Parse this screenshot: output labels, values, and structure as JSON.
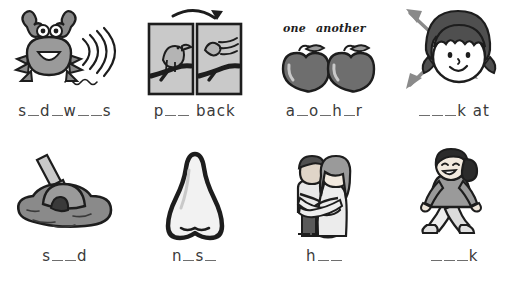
{
  "worksheet": {
    "colors": {
      "ink": "#1d1d1d",
      "fill_dark": "#6e6e6e",
      "fill_mid": "#9a9a9a",
      "fill_light": "#c9c9c9",
      "paper": "#ffffff",
      "blank_line": "#6e6e6e"
    },
    "rows": [
      {
        "items": [
          {
            "icon": "crab-with-motion-lines-icon",
            "label_segments": [
              {
                "type": "text",
                "value": "s"
              },
              {
                "type": "blank"
              },
              {
                "type": "text",
                "value": "d"
              },
              {
                "type": "blank"
              },
              {
                "type": "text",
                "value": "w"
              },
              {
                "type": "blank"
              },
              {
                "type": "blank"
              },
              {
                "type": "text",
                "value": "s"
              }
            ],
            "label_plain": "s_d_w__s"
          },
          {
            "icon": "bird-flying-back-two-panels-icon",
            "label_segments": [
              {
                "type": "text",
                "value": "p"
              },
              {
                "type": "blank"
              },
              {
                "type": "blank"
              },
              {
                "type": "text",
                "value": " back"
              }
            ],
            "label_plain": "p__ back"
          },
          {
            "icon": "two-apples-icon",
            "caption": {
              "word_one": "one",
              "word_two": "another"
            },
            "label_segments": [
              {
                "type": "text",
                "value": "a"
              },
              {
                "type": "blank"
              },
              {
                "type": "text",
                "value": "o"
              },
              {
                "type": "blank"
              },
              {
                "type": "text",
                "value": "h"
              },
              {
                "type": "blank"
              },
              {
                "type": "text",
                "value": "r"
              }
            ],
            "label_plain": "a_o_h_r"
          },
          {
            "icon": "girl-face-with-double-arrow-icon",
            "label_segments": [
              {
                "type": "blank"
              },
              {
                "type": "blank"
              },
              {
                "type": "blank"
              },
              {
                "type": "text",
                "value": "k at"
              }
            ],
            "label_plain": "___k at"
          }
        ]
      },
      {
        "items": [
          {
            "icon": "sand-pile-with-shovel-icon",
            "label_segments": [
              {
                "type": "text",
                "value": "s"
              },
              {
                "type": "blank"
              },
              {
                "type": "blank"
              },
              {
                "type": "text",
                "value": "d"
              }
            ],
            "label_plain": "s__d"
          },
          {
            "icon": "nose-icon",
            "label_segments": [
              {
                "type": "text",
                "value": "n"
              },
              {
                "type": "blank"
              },
              {
                "type": "text",
                "value": "s"
              },
              {
                "type": "blank"
              }
            ],
            "label_plain": "n_s_"
          },
          {
            "icon": "couple-hugging-icon",
            "label_segments": [
              {
                "type": "text",
                "value": "h"
              },
              {
                "type": "blank"
              },
              {
                "type": "blank"
              }
            ],
            "label_plain": "h__"
          },
          {
            "icon": "girl-walking-icon",
            "label_segments": [
              {
                "type": "blank"
              },
              {
                "type": "blank"
              },
              {
                "type": "blank"
              },
              {
                "type": "text",
                "value": "k"
              }
            ],
            "label_plain": "___k"
          }
        ]
      }
    ]
  }
}
